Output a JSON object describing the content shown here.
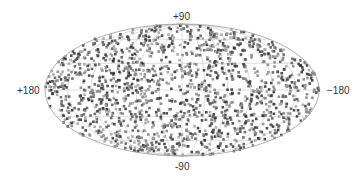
{
  "chart_data": {
    "type": "scatter",
    "projection": "mollweide",
    "title": "",
    "xlabel": "",
    "ylabel": "",
    "tick_labels": {
      "top": "+90",
      "bottom": "-90",
      "left": "+180",
      "right": "−180"
    },
    "xlim": [
      180,
      -180
    ],
    "ylim": [
      -90,
      90
    ],
    "grid": true,
    "legend": null,
    "n_points_approx": 1500,
    "point_colors": [
      "#555555",
      "#808080",
      "#a0a0a0",
      "#2f2f2f"
    ],
    "distribution": "roughly uniform over the sphere",
    "outline_color": "#999999",
    "grid_color": "#bbbbbb"
  }
}
